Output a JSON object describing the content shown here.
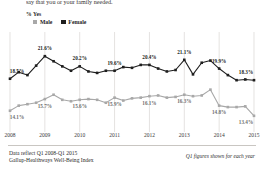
{
  "question_text": "say that you or your family needed.",
  "axis_note": "% Yes",
  "legend": [
    {
      "label": "Male",
      "color": "#a8a8a8",
      "key": "male"
    },
    {
      "label": "Female",
      "color": "#1e1e1e",
      "key": "female"
    }
  ],
  "footer": {
    "line1": "Data reflect Q1 2008-Q1 2015",
    "line2": "Gallup-Healthways Well-Being Index",
    "note": "Q1 figures shown for each year"
  },
  "chart_data": {
    "type": "line",
    "title": "",
    "subtitle": "",
    "xlabel": "",
    "ylabel": "% Yes",
    "ylim": [
      12.0,
      23.0
    ],
    "grid": "vertical-only",
    "legend_position": "top-left",
    "x_tick_labels": [
      "2008",
      "2009",
      "2010",
      "2011",
      "2012",
      "2013",
      "2014",
      "2015"
    ],
    "x_tick_indices": [
      0,
      4,
      8,
      12,
      16,
      20,
      24,
      28
    ],
    "x": [
      "Q1 2008",
      "Q2 2008",
      "Q3 2008",
      "Q4 2008",
      "Q1 2009",
      "Q2 2009",
      "Q3 2009",
      "Q4 2009",
      "Q1 2010",
      "Q2 2010",
      "Q3 2010",
      "Q4 2010",
      "Q1 2011",
      "Q2 2011",
      "Q3 2011",
      "Q4 2011",
      "Q1 2012",
      "Q2 2012",
      "Q3 2012",
      "Q4 2012",
      "Q1 2013",
      "Q2 2013",
      "Q3 2013",
      "Q4 2013",
      "Q1 2014",
      "Q2 2014",
      "Q3 2014",
      "Q4 2014",
      "Q1 2015"
    ],
    "series": [
      {
        "name": "Female",
        "color": "#1e1e1e",
        "marker": "square",
        "values": [
          18.5,
          19.4,
          19.0,
          20.3,
          21.6,
          20.9,
          20.2,
          19.6,
          20.2,
          19.5,
          19.3,
          19.6,
          19.6,
          20.1,
          20.0,
          20.4,
          20.4,
          19.9,
          19.5,
          19.7,
          21.1,
          19.1,
          20.7,
          21.0,
          19.9,
          19.0,
          18.3,
          18.4,
          18.3
        ],
        "labeled_points": [
          {
            "index": 0,
            "value": 18.5,
            "text": "18.5%"
          },
          {
            "index": 4,
            "value": 21.6,
            "text": "21.6%"
          },
          {
            "index": 8,
            "value": 20.2,
            "text": "20.2%"
          },
          {
            "index": 12,
            "value": 19.6,
            "text": "19.6%"
          },
          {
            "index": 16,
            "value": 20.4,
            "text": "20.4%"
          },
          {
            "index": 20,
            "value": 21.1,
            "text": "21.1%"
          },
          {
            "index": 24,
            "value": 19.9,
            "text": "19.9%"
          },
          {
            "index": 28,
            "value": 18.3,
            "text": "18.3%"
          }
        ]
      },
      {
        "name": "Male",
        "color": "#a8a8a8",
        "marker": "square",
        "values": [
          14.1,
          14.8,
          15.0,
          15.2,
          15.7,
          16.3,
          15.6,
          15.4,
          15.6,
          15.7,
          15.6,
          15.2,
          15.9,
          15.5,
          15.8,
          15.9,
          16.1,
          16.2,
          15.9,
          16.0,
          16.3,
          16.1,
          16.2,
          17.0,
          14.8,
          14.6,
          14.6,
          14.7,
          13.4
        ],
        "labeled_points": [
          {
            "index": 0,
            "value": 14.1,
            "text": "14.1%"
          },
          {
            "index": 4,
            "value": 15.7,
            "text": "15.7%"
          },
          {
            "index": 8,
            "value": 15.6,
            "text": "15.6%"
          },
          {
            "index": 12,
            "value": 15.9,
            "text": "15.9%"
          },
          {
            "index": 16,
            "value": 16.1,
            "text": "16.1%"
          },
          {
            "index": 20,
            "value": 16.3,
            "text": "16.3%"
          },
          {
            "index": 24,
            "value": 14.8,
            "text": "14.8%"
          },
          {
            "index": 28,
            "value": 13.4,
            "text": "13.4%"
          }
        ]
      }
    ]
  }
}
